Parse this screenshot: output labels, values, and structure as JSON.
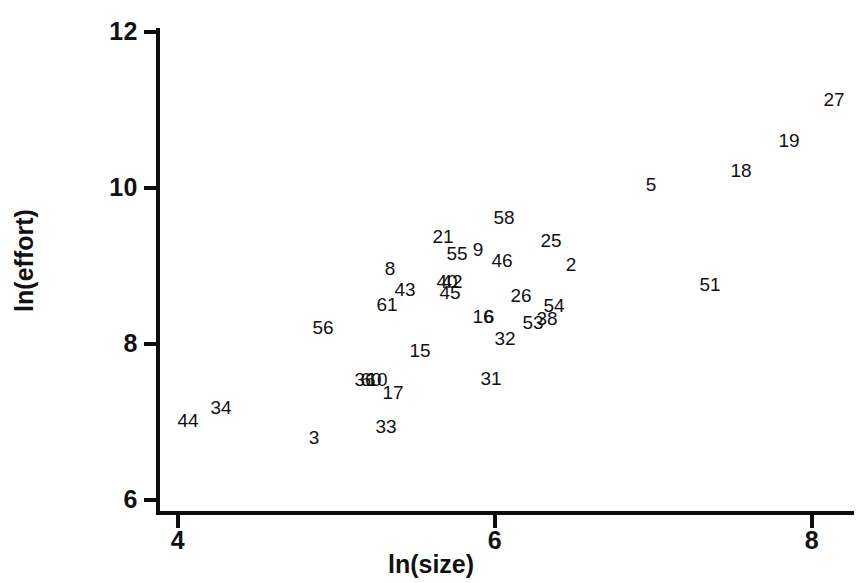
{
  "chart_data": {
    "type": "scatter",
    "title": "",
    "xlabel": "ln(size)",
    "ylabel": "ln(effort)",
    "xlim": [
      4,
      8
    ],
    "ylim": [
      6,
      12
    ],
    "xticks": [
      "4",
      "6",
      "8"
    ],
    "yticks": [
      "6",
      "8",
      "10",
      "12"
    ],
    "grid": false,
    "legend": null,
    "marker_style": "text-label-only",
    "note": "Each data point is rendered as its case-number label rather than a plotting symbol.",
    "points": [
      {
        "label": "27",
        "x": 8.25,
        "y": 10.9
      },
      {
        "label": "19",
        "x": 7.97,
        "y": 10.55
      },
      {
        "label": "18",
        "x": 7.67,
        "y": 10.17
      },
      {
        "label": "5",
        "x": 7.1,
        "y": 10.0
      },
      {
        "label": "51",
        "x": 7.47,
        "y": 8.72
      },
      {
        "label": "58",
        "x": 6.0,
        "y": 9.57
      },
      {
        "label": "25",
        "x": 6.3,
        "y": 9.27
      },
      {
        "label": "21",
        "x": 5.66,
        "y": 9.33
      },
      {
        "label": "9",
        "x": 5.88,
        "y": 9.17
      },
      {
        "label": "55",
        "x": 5.75,
        "y": 9.13
      },
      {
        "label": "46",
        "x": 6.03,
        "y": 9.04
      },
      {
        "label": "2",
        "x": 6.47,
        "y": 9.0
      },
      {
        "label": "8",
        "x": 5.33,
        "y": 8.9
      },
      {
        "label": "43",
        "x": 5.52,
        "y": 8.63
      },
      {
        "label": "40",
        "x": 5.67,
        "y": 8.73
      },
      {
        "label": "42",
        "x": 5.72,
        "y": 8.73
      },
      {
        "label": "45",
        "x": 5.7,
        "y": 8.62
      },
      {
        "label": "61",
        "x": 5.44,
        "y": 8.45
      },
      {
        "label": "26",
        "x": 6.29,
        "y": 8.53
      },
      {
        "label": "54",
        "x": 6.49,
        "y": 8.42
      },
      {
        "label": "53",
        "x": 6.23,
        "y": 8.22
      },
      {
        "label": "38",
        "x": 6.4,
        "y": 8.27
      },
      {
        "label": "16",
        "x": 5.94,
        "y": 8.35
      },
      {
        "label": "6",
        "x": 5.99,
        "y": 8.35
      },
      {
        "label": "56",
        "x": 4.8,
        "y": 8.25
      },
      {
        "label": "32",
        "x": 6.13,
        "y": 8.07
      },
      {
        "label": "15",
        "x": 5.36,
        "y": 7.9
      },
      {
        "label": "31",
        "x": 6.07,
        "y": 7.56
      },
      {
        "label": "36",
        "x": 5.2,
        "y": 7.58
      },
      {
        "label": "60",
        "x": 5.25,
        "y": 7.58
      },
      {
        "label": "10",
        "x": 5.3,
        "y": 7.58
      },
      {
        "label": "17",
        "x": 5.44,
        "y": 7.42
      },
      {
        "label": "33",
        "x": 5.4,
        "y": 6.97
      },
      {
        "label": "3",
        "x": 4.85,
        "y": 6.85
      },
      {
        "label": "34",
        "x": 4.27,
        "y": 7.17
      },
      {
        "label": "44",
        "x": 4.06,
        "y": 7.02
      }
    ]
  },
  "axes": {
    "y_ticks": [
      {
        "value": "12",
        "px": 32
      },
      {
        "value": "10",
        "px": 188
      },
      {
        "value": "8",
        "px": 344
      },
      {
        "value": "6",
        "px": 500
      }
    ],
    "x_ticks": [
      {
        "value": "4",
        "px": 178
      },
      {
        "value": "6",
        "px": 495
      },
      {
        "value": "8",
        "px": 812
      }
    ],
    "x_title": "ln(size)",
    "y_title": "ln(effort)",
    "axis_color": "#0d0d0d"
  },
  "point_pixels": [
    {
      "label": "27",
      "left": 834,
      "top": 99
    },
    {
      "label": "19",
      "left": 789,
      "top": 140
    },
    {
      "label": "18",
      "left": 741,
      "top": 170
    },
    {
      "label": "5",
      "left": 651,
      "top": 184
    },
    {
      "label": "51",
      "left": 710,
      "top": 284
    },
    {
      "label": "58",
      "left": 504,
      "top": 217
    },
    {
      "label": "25",
      "left": 551,
      "top": 240
    },
    {
      "label": "21",
      "left": 443,
      "top": 236
    },
    {
      "label": "9",
      "left": 478,
      "top": 249
    },
    {
      "label": "55",
      "left": 457,
      "top": 253
    },
    {
      "label": "46",
      "left": 502,
      "top": 260
    },
    {
      "label": "2",
      "left": 571,
      "top": 264
    },
    {
      "label": "8",
      "left": 390,
      "top": 268
    },
    {
      "label": "43",
      "left": 405,
      "top": 289
    },
    {
      "label": "40",
      "left": 447,
      "top": 281
    },
    {
      "label": "42",
      "left": 452,
      "top": 281
    },
    {
      "label": "45",
      "left": 450,
      "top": 292
    },
    {
      "label": "61",
      "left": 387,
      "top": 304
    },
    {
      "label": "26",
      "left": 521,
      "top": 295
    },
    {
      "label": "54",
      "left": 554,
      "top": 305
    },
    {
      "label": "53",
      "left": 533,
      "top": 322
    },
    {
      "label": "38",
      "left": 547,
      "top": 318
    },
    {
      "label": "16",
      "left": 483,
      "top": 316
    },
    {
      "label": "6",
      "left": 489,
      "top": 316
    },
    {
      "label": "56",
      "left": 323,
      "top": 327
    },
    {
      "label": "32",
      "left": 505,
      "top": 338
    },
    {
      "label": "15",
      "left": 420,
      "top": 350
    },
    {
      "label": "31",
      "left": 491,
      "top": 378
    },
    {
      "label": "36",
      "left": 365,
      "top": 379
    },
    {
      "label": "60",
      "left": 371,
      "top": 379
    },
    {
      "label": "10",
      "left": 377,
      "top": 379
    },
    {
      "label": "17",
      "left": 393,
      "top": 392
    },
    {
      "label": "33",
      "left": 386,
      "top": 426
    },
    {
      "label": "3",
      "left": 314,
      "top": 437
    },
    {
      "label": "34",
      "left": 221,
      "top": 407
    },
    {
      "label": "44",
      "left": 188,
      "top": 420
    }
  ]
}
